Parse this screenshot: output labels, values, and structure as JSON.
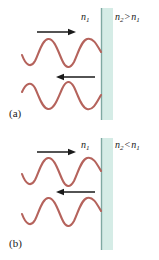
{
  "figure": {
    "background_color": "#ffffff",
    "wave_color": "#b5635c",
    "arrow_color": "#1a1a1a",
    "boundary_line_color": "#8fb3ad",
    "medium2_fill_color": "#d5ece6",
    "text_color": "#1a1a1a"
  },
  "panels": [
    {
      "tag": "(a)",
      "condition": "n2 > n1",
      "medium1_label": "n",
      "medium1_sub": "1",
      "medium2_left": "n",
      "medium2_left_sub": "2",
      "relation": ">",
      "medium2_right": "n",
      "medium2_right_sub": "1",
      "incident_arrow_direction": "right",
      "reflected_arrow_direction": "left",
      "phase_change": "180 degrees",
      "incident_wave_at_boundary": "crest",
      "reflected_wave_at_boundary": "trough"
    },
    {
      "tag": "(b)",
      "condition": "n2 < n1",
      "medium1_label": "n",
      "medium1_sub": "1",
      "medium2_left": "n",
      "medium2_left_sub": "2",
      "relation": "<",
      "medium2_right": "n",
      "medium2_right_sub": "1",
      "incident_arrow_direction": "right",
      "reflected_arrow_direction": "left",
      "phase_change": "none",
      "incident_wave_at_boundary": "crest",
      "reflected_wave_at_boundary": "crest"
    }
  ]
}
